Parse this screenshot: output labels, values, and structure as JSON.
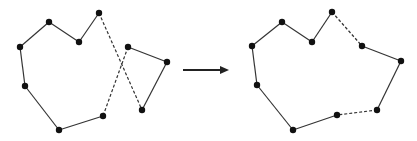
{
  "diagram": {
    "type": "tour-merge",
    "colors": {
      "line": "#333333",
      "node": "#111111",
      "arrow": "#222222",
      "background": "#ffffff"
    },
    "before": {
      "nodes": [
        {
          "id": "a1",
          "x": 20,
          "y": 47
        },
        {
          "id": "a2",
          "x": 49,
          "y": 22
        },
        {
          "id": "a3",
          "x": 79,
          "y": 42
        },
        {
          "id": "a4",
          "x": 99,
          "y": 13
        },
        {
          "id": "a5",
          "x": 142,
          "y": 110
        },
        {
          "id": "a6",
          "x": 167,
          "y": 62
        },
        {
          "id": "a7",
          "x": 128,
          "y": 47
        },
        {
          "id": "a8",
          "x": 103,
          "y": 116
        },
        {
          "id": "a9",
          "x": 59,
          "y": 130
        },
        {
          "id": "a10",
          "x": 25,
          "y": 86
        }
      ],
      "edges": [
        {
          "from": "a1",
          "to": "a2",
          "style": "solid"
        },
        {
          "from": "a2",
          "to": "a3",
          "style": "solid"
        },
        {
          "from": "a3",
          "to": "a4",
          "style": "solid"
        },
        {
          "from": "a4",
          "to": "a5",
          "style": "dashed"
        },
        {
          "from": "a5",
          "to": "a6",
          "style": "solid"
        },
        {
          "from": "a6",
          "to": "a7",
          "style": "solid"
        },
        {
          "from": "a7",
          "to": "a8",
          "style": "dashed"
        },
        {
          "from": "a8",
          "to": "a9",
          "style": "solid"
        },
        {
          "from": "a9",
          "to": "a10",
          "style": "solid"
        },
        {
          "from": "a10",
          "to": "a1",
          "style": "solid"
        }
      ]
    },
    "arrow": {
      "x1": 183,
      "y1": 70,
      "x2": 229,
      "y2": 70
    },
    "after": {
      "nodes": [
        {
          "id": "b1",
          "x": 252,
          "y": 46
        },
        {
          "id": "b2",
          "x": 282,
          "y": 22
        },
        {
          "id": "b3",
          "x": 312,
          "y": 42
        },
        {
          "id": "b4",
          "x": 332,
          "y": 12
        },
        {
          "id": "b5",
          "x": 362,
          "y": 46
        },
        {
          "id": "b6",
          "x": 401,
          "y": 61
        },
        {
          "id": "b7",
          "x": 377,
          "y": 110
        },
        {
          "id": "b8",
          "x": 337,
          "y": 115
        },
        {
          "id": "b9",
          "x": 293,
          "y": 130
        },
        {
          "id": "b10",
          "x": 257,
          "y": 85
        }
      ],
      "edges": [
        {
          "from": "b1",
          "to": "b2",
          "style": "solid"
        },
        {
          "from": "b2",
          "to": "b3",
          "style": "solid"
        },
        {
          "from": "b3",
          "to": "b4",
          "style": "solid"
        },
        {
          "from": "b4",
          "to": "b5",
          "style": "dashed"
        },
        {
          "from": "b5",
          "to": "b6",
          "style": "solid"
        },
        {
          "from": "b6",
          "to": "b7",
          "style": "solid"
        },
        {
          "from": "b7",
          "to": "b8",
          "style": "dashed"
        },
        {
          "from": "b8",
          "to": "b9",
          "style": "solid"
        },
        {
          "from": "b9",
          "to": "b10",
          "style": "solid"
        },
        {
          "from": "b10",
          "to": "b1",
          "style": "solid"
        }
      ]
    }
  }
}
